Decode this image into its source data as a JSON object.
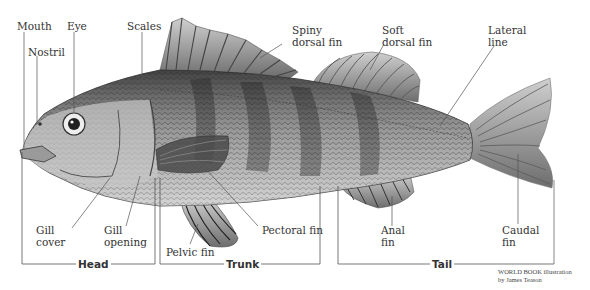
{
  "diagram": {
    "labels": {
      "mouth": "Mouth",
      "nostril": "Nostril",
      "eye": "Eye",
      "scales": "Scales",
      "spiny_dorsal_fin": [
        "Spiny",
        "dorsal fin"
      ],
      "soft_dorsal_fin": [
        "Soft",
        "dorsal fin"
      ],
      "lateral_line": [
        "Lateral",
        "line"
      ],
      "gill_cover": [
        "Gill",
        "cover"
      ],
      "gill_opening": [
        "Gill",
        "opening"
      ],
      "pelvic_fin": "Pelvic fin",
      "pectoral_fin": "Pectoral fin",
      "anal_fin": [
        "Anal",
        "fin"
      ],
      "caudal_fin": [
        "Caudal",
        "fin"
      ]
    },
    "sections": {
      "head": "Head",
      "trunk": "Trunk",
      "tail": "Tail"
    },
    "credit": [
      "WORLD BOOK illustration",
      "by James Teason"
    ]
  }
}
